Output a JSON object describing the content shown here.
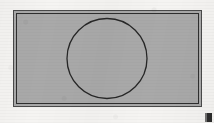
{
  "document": {
    "title": "Scanned geometric figure",
    "medium": "scanned paper",
    "canvas": {
      "width": 214,
      "height": 123,
      "background_color": "#f5f4f2"
    }
  },
  "figure": {
    "caption": "",
    "shapes": [
      {
        "name": "outer-rectangle",
        "type": "rectangle",
        "x": 13,
        "y": 10,
        "width": 189,
        "height": 97,
        "stroke_color": "#4a4a4a",
        "stroke_width": 1,
        "fill_color": "#a9a9a9"
      },
      {
        "name": "inner-rectangle",
        "type": "rectangle",
        "x": 16,
        "y": 13,
        "width": 183,
        "height": 91,
        "stroke_color": "#2e2e2e",
        "stroke_width": 1,
        "fill_color": "none"
      },
      {
        "name": "inscribed-circle",
        "type": "circle",
        "cx": 107,
        "cy": 58,
        "r": 40,
        "stroke_color": "#262626",
        "stroke_width": 1.3,
        "fill_color": "none"
      }
    ],
    "marks": [
      {
        "name": "registration-mark",
        "type": "square",
        "x": 205,
        "y": 113,
        "width": 7,
        "height": 9,
        "color": "#2b2b2b"
      }
    ]
  },
  "colors": {
    "paper": "#f5f4f2",
    "plate_fill": "#a9a9a9",
    "outline_dark": "#262626",
    "outline_mid": "#4a4a4a",
    "mark": "#2b2b2b"
  }
}
